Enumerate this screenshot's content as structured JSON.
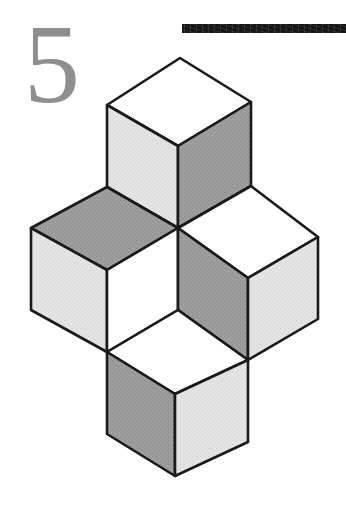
{
  "page": {
    "background_color": "#ffffff",
    "width": 346,
    "height": 515,
    "kind": "book-chapter-opener"
  },
  "chapter": {
    "number": "5",
    "number_color": "#8e8e8e"
  },
  "rule_bar": {
    "color": "#151515",
    "label": ""
  },
  "figure": {
    "title": "",
    "caption": "",
    "palette": {
      "white_face": "#ffffff",
      "light_gray_face": "#e2e2e2",
      "mid_gray_face": "#d6d6d6",
      "dark_gray_face": "#9b9b9b",
      "outline": "#1a1a1a"
    },
    "cubes": [
      {
        "name": "top-cube",
        "top_face": "white",
        "left_face": "light-gray",
        "right_face": "dark-gray"
      },
      {
        "name": "left-cube",
        "top_face": "dark-gray",
        "left_face": "light-gray",
        "right_face": "white"
      },
      {
        "name": "right-cube",
        "top_face": "white",
        "left_face": "dark-gray",
        "right_face": "light-gray"
      },
      {
        "name": "bottom-cube",
        "top_face": "white",
        "left_face": "dark-gray",
        "right_face": "light-gray"
      }
    ]
  }
}
